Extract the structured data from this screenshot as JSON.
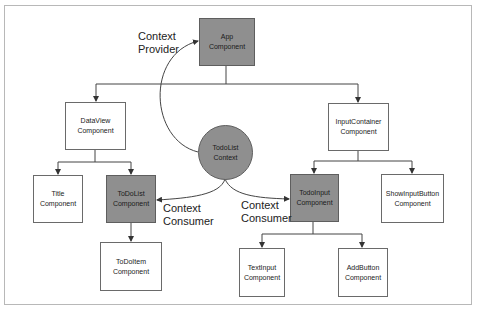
{
  "diagram": {
    "colors": {
      "provider_consumer_fill": "#8f8f8f",
      "plain_fill": "#ffffff",
      "line": "#444444"
    },
    "nodes": {
      "app": {
        "line1": "App",
        "line2": "Component"
      },
      "dataview": {
        "line1": "DataView",
        "line2": "Component"
      },
      "inputcontainer": {
        "line1": "InputContainer",
        "line2": "Component"
      },
      "context": {
        "line1": "TodoList",
        "line2": "Context"
      },
      "title": {
        "line1": "Title",
        "line2": "Component"
      },
      "todolist": {
        "line1": "ToDoList",
        "line2": "Component"
      },
      "todoinput": {
        "line1": "TodoInput",
        "line2": "Component"
      },
      "showinputbutton": {
        "line1": "ShowInputButton",
        "line2": "Component"
      },
      "todoitem": {
        "line1": "ToDoItem",
        "line2": "Component"
      },
      "textinput": {
        "line1": "TextInput",
        "line2": "Component"
      },
      "addbutton": {
        "line1": "AddButton",
        "line2": "Component"
      }
    },
    "labels": {
      "provider": {
        "line1": "Context",
        "line2": "Provider"
      },
      "consumer_left": {
        "line1": "Context",
        "line2": "Consumer"
      },
      "consumer_right": {
        "line1": "Context",
        "line2": "Consumer"
      }
    },
    "edges": [
      [
        "app",
        "dataview"
      ],
      [
        "app",
        "inputcontainer"
      ],
      [
        "dataview",
        "title"
      ],
      [
        "dataview",
        "todolist"
      ],
      [
        "inputcontainer",
        "todoinput"
      ],
      [
        "inputcontainer",
        "showinputbutton"
      ],
      [
        "todolist",
        "todoitem"
      ],
      [
        "todoinput",
        "textinput"
      ],
      [
        "todoinput",
        "addbutton"
      ],
      [
        "context",
        "app",
        "Context Provider"
      ],
      [
        "context",
        "todolist",
        "Context Consumer"
      ],
      [
        "context",
        "todoinput",
        "Context Consumer"
      ]
    ]
  }
}
